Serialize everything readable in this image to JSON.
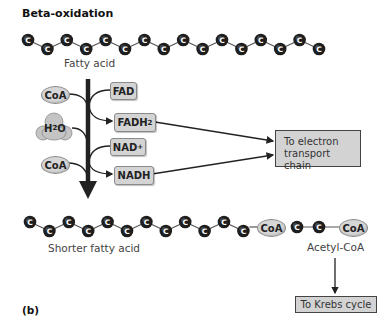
{
  "title": "Beta-oxidation",
  "panel_label": "(b)",
  "carbon_symbol": "C",
  "fatty_acid": {
    "label": "Fatty acid",
    "carbon_count": 16
  },
  "inputs": [
    {
      "id": "coa_1",
      "label": "CoA"
    },
    {
      "id": "water",
      "label_main": "H",
      "label_sub": "2",
      "label_end": "O"
    },
    {
      "id": "coa_2",
      "label": "CoA"
    }
  ],
  "cofactors": {
    "fad": "FAD",
    "fadh2_main": "FADH",
    "fadh2_sub": "2",
    "nad_main": "NAD",
    "nad_sup": "+",
    "nadh": "NADH"
  },
  "electron_transport_box": {
    "line1": "To electron",
    "line2": "transport chain"
  },
  "shorter_fatty_acid": {
    "label": "Shorter fatty acid",
    "carbon_count": 12,
    "end_group": "CoA"
  },
  "acetyl_coa": {
    "label": "Acetyl-CoA",
    "carbon_count": 2,
    "end_group": "CoA"
  },
  "krebs_box": {
    "label": "To Krebs cycle"
  },
  "colors": {
    "carbon": "#1e1e1e",
    "pill_fill": "#d6d6d6",
    "box_fill": "#d3d3d3",
    "arrow": "#222222"
  }
}
